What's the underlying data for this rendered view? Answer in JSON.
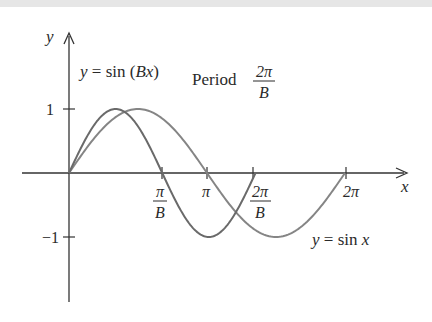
{
  "colors": {
    "axis": "#333333",
    "curve_sinBx": "#6a6a6a",
    "curve_sinx": "#858585",
    "text": "#2a2a2a",
    "top_band": "#e6e6e6"
  },
  "labels": {
    "y_axis": "y",
    "x_axis": "x",
    "curve_sinBx": "y = sin (Bx)",
    "curve_sinx": "y = sin x",
    "period_word": "Period",
    "period_num": "2π",
    "period_den": "B"
  },
  "ticks": {
    "y": [
      {
        "label": "1"
      },
      {
        "label": "−1"
      }
    ],
    "x": [
      {
        "num": "π",
        "den": "B"
      },
      {
        "label": "π"
      },
      {
        "num": "2π",
        "den": "B"
      },
      {
        "label": "2π"
      }
    ]
  },
  "chart_data": {
    "type": "line",
    "title": "",
    "xlabel": "x",
    "ylabel": "y",
    "grid": false,
    "ylim": [
      -1,
      1
    ],
    "x_ticks": [
      "π/B",
      "π",
      "2π/B",
      "2π"
    ],
    "y_ticks": [
      "1",
      "−1"
    ],
    "annotations": [
      "y = sin (Bx)",
      "Period 2π/B",
      "y = sin x"
    ],
    "series": [
      {
        "name": "y = sin (Bx)",
        "B_approx": 1.48,
        "x_range": [
          0,
          "2π/B"
        ],
        "peak": 1,
        "trough": -1
      },
      {
        "name": "y = sin x",
        "x_range": [
          0,
          "2π"
        ],
        "peak": 1,
        "trough": -1
      }
    ]
  }
}
